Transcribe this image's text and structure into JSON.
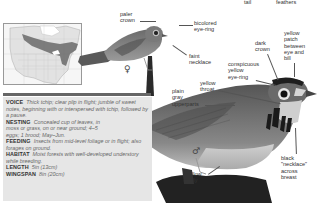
{
  "top_labels": {
    "tail": "tail",
    "feathers": "feathers"
  },
  "female": {
    "symbol": "♀",
    "labels": {
      "paler_crown": "paler\ncrown",
      "bicolored_eye_ring": "bicolored\neye-ring",
      "faint_necklace": "faint\nnecklace"
    }
  },
  "male": {
    "symbol": "♂",
    "labels": {
      "dark_crown": "dark\ncrown",
      "yellow_patch": "yellow\npatch\nbetween\neye and\nbill",
      "conspicuous_eye_ring": "conspicuous\nyellow\neye-ring",
      "yellow_throat": "yellow\nthroat",
      "plain_gray_upperparts": "plain\ngray\nupperparts",
      "yellow_belly": "yellow\nbelly",
      "black_necklace": "black\n\"necklace\"\nacross\nbreast"
    }
  },
  "range_map": {
    "name": "North America range map"
  },
  "info": {
    "voice_label": "VOICE",
    "voice_text": "Thick tchip; clear plip in flight; jumble of sweet notes, beginning with or interspersed with tchip, followed by a pause.",
    "nesting_label": "NESTING",
    "nesting_text": "Concealed cup of leaves, in moss or grass, on or near ground; 4–5 eggs; 1 brood; May–Jun.",
    "feeding_label": "FEEDING",
    "feeding_text": "Insects from mid-level foliage or in flight; also forages on ground.",
    "habitat_label": "HABITAT",
    "habitat_text": "Moist forests with well-developed understory while breeding.",
    "length_label": "LENGTH",
    "length_text": "5in (13cm)",
    "wingspan_label": "WINGSPAN",
    "wingspan_text": "8in (20cm)"
  }
}
